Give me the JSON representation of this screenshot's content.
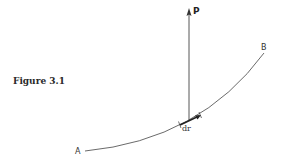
{
  "figure": {
    "caption": "Figure 3.1",
    "labels": {
      "force": "P",
      "start": "A",
      "end": "B",
      "displacement": "dr"
    },
    "colors": {
      "ink": "#333333",
      "background": "#ffffff"
    }
  }
}
